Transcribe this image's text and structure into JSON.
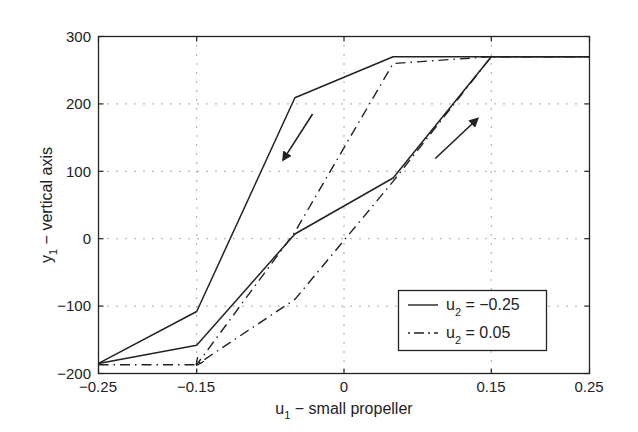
{
  "chart_data": {
    "type": "line",
    "title": "",
    "xlabel": "u_1 - small propeller",
    "ylabel": "y_1 - vertical axis",
    "xlim": [
      -0.25,
      0.25
    ],
    "ylim": [
      -200,
      300
    ],
    "grid": true,
    "x_ticks": [
      "-0.25",
      "-0.15",
      "0",
      "0.15",
      "0.25"
    ],
    "y_ticks": [
      "-200",
      "-100",
      "0",
      "100",
      "200",
      "300"
    ],
    "legend_position": "lower right",
    "series": [
      {
        "name": "u_2 = -0.25",
        "style": "solid",
        "branches": [
          {
            "direction": "increasing",
            "x": [
              -0.25,
              -0.15,
              -0.05,
              0.05,
              0.15,
              0.25
            ],
            "y": [
              -185,
              -158,
              7,
              90,
              270,
              270
            ]
          },
          {
            "direction": "decreasing",
            "x": [
              0.25,
              0.15,
              0.05,
              -0.05,
              -0.15,
              -0.25
            ],
            "y": [
              270,
              270,
              270,
              209,
              -108,
              -185
            ]
          }
        ]
      },
      {
        "name": "u_2 = 0.05",
        "style": "dash-dot",
        "branches": [
          {
            "direction": "increasing",
            "x": [
              -0.25,
              -0.15,
              -0.05,
              0.05,
              0.15,
              0.25
            ],
            "y": [
              -187,
              -187,
              -90,
              85,
              270,
              270
            ]
          },
          {
            "direction": "decreasing",
            "x": [
              0.15,
              0.05,
              -0.05,
              -0.15
            ],
            "y": [
              270,
              260,
              10,
              -187
            ]
          }
        ]
      }
    ],
    "annotations": [
      {
        "type": "arrow",
        "meaning": "decreasing u_1 branch",
        "from": [
          -0.032,
          185
        ],
        "to": [
          -0.062,
          117
        ]
      },
      {
        "type": "arrow",
        "meaning": "increasing u_1 branch",
        "from": [
          0.093,
          119
        ],
        "to": [
          0.136,
          178
        ]
      }
    ]
  },
  "axes": {
    "x_ticks": [
      "−0.25",
      "−0.15",
      "0",
      "0.15",
      "0.25"
    ],
    "y_ticks": [
      "300",
      "200",
      "100",
      "0",
      "−100",
      "−200"
    ],
    "xlabel_main": "u",
    "xlabel_sub": "1",
    "xlabel_rest": " − small propeller",
    "ylabel_main": "y",
    "ylabel_sub": "1",
    "ylabel_rest": " − vertical axis"
  },
  "legend": {
    "items": [
      {
        "main": "u",
        "sub": "2",
        "rest": " = −0.25"
      },
      {
        "main": "u",
        "sub": "2",
        "rest": " = 0.05"
      }
    ]
  }
}
